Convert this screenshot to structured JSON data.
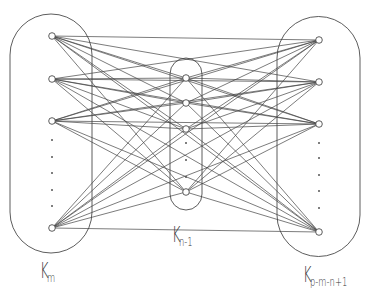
{
  "diagram": {
    "type": "graph",
    "colors": {
      "stroke": "#333333",
      "background": "#ffffff"
    },
    "groups": [
      {
        "id": "left",
        "label_main": "K",
        "label_sub": "m",
        "nodes_shown": 4,
        "dots": 5
      },
      {
        "id": "middle",
        "label_main": "K",
        "label_sub": "n-1",
        "nodes_shown": 4,
        "dots": 3
      },
      {
        "id": "right",
        "label_main": "K",
        "label_sub": "p-m-n+1",
        "nodes_shown": 4,
        "dots": 5
      }
    ]
  }
}
